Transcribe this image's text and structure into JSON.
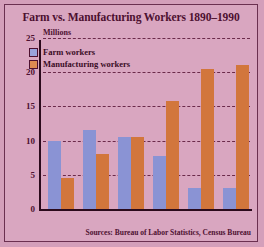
{
  "chart_data": {
    "type": "bar",
    "title": "Farm vs. Manufacturing Workers 1890–1990",
    "xlabel": "",
    "ylabel": "Millions",
    "categories": [
      "1890",
      "1910",
      "1930",
      "1950",
      "1970",
      "1990"
    ],
    "series": [
      {
        "name": "Farm workers",
        "color": "#8a93d4",
        "values": [
          10.0,
          11.5,
          10.5,
          7.8,
          3.0,
          3.0
        ]
      },
      {
        "name": "Manufacturing workers",
        "color": "#d2763c",
        "values": [
          4.5,
          8.0,
          10.5,
          15.8,
          20.5,
          21.0
        ]
      }
    ],
    "ylim": [
      0,
      25
    ],
    "yticks": [
      0,
      5,
      10,
      15,
      20,
      25
    ],
    "grid": true,
    "legend_position": "inside-top-left",
    "annotations": [
      "Sources: Bureau of Labor Statistics, Census Bureau"
    ]
  },
  "labels": {
    "units": "Millions",
    "source": "Sources: Bureau of Labor Statistics, Census Bureau"
  },
  "colors": {
    "background": "#d9a6c0",
    "border": "#6b3050",
    "text": "#4d1030",
    "farm": "#8a93d4",
    "manufacturing": "#d2763c"
  }
}
